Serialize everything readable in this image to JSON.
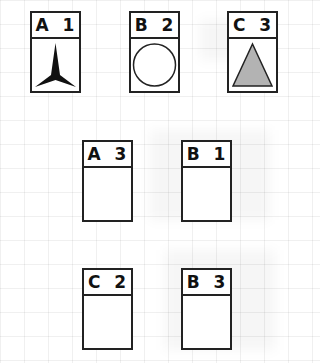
{
  "cards": [
    {
      "id": "A1",
      "label": "A 1",
      "shape": "three-point-star",
      "fill": "#111111"
    },
    {
      "id": "B2",
      "label": "B 2",
      "shape": "circle",
      "fill": "#ffffff"
    },
    {
      "id": "C3",
      "label": "C 3",
      "shape": "triangle",
      "fill": "#b3b3b3"
    },
    {
      "id": "A3",
      "label": "A 3",
      "shape": "empty"
    },
    {
      "id": "B1",
      "label": "B 1",
      "shape": "empty"
    },
    {
      "id": "C2",
      "label": "C 2",
      "shape": "empty"
    },
    {
      "id": "B3",
      "label": "B 3",
      "shape": "empty"
    }
  ]
}
